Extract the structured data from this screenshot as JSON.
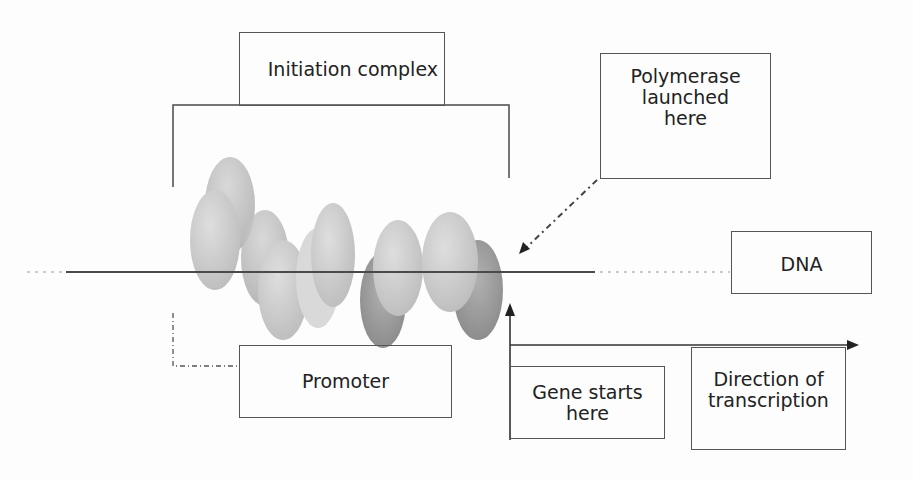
{
  "diagram": {
    "type": "gene transcription initiation schematic",
    "labels": {
      "initiation_complex": "Initiation complex",
      "polymerase_launched": "Polymerase\nlaunched\nhere",
      "dna": "DNA",
      "promoter": "Promoter",
      "gene_starts": "Gene starts\nhere",
      "direction": "Direction of\ntranscription"
    },
    "colors": {
      "line": "#4a4a4a",
      "box_border": "#555555",
      "protein_light": "#cfcfcf",
      "protein_mid": "#b8b8b8",
      "protein_dark": "#8e8e8e",
      "background": "#fdfdfd"
    },
    "protein_subunit_count": 5
  }
}
